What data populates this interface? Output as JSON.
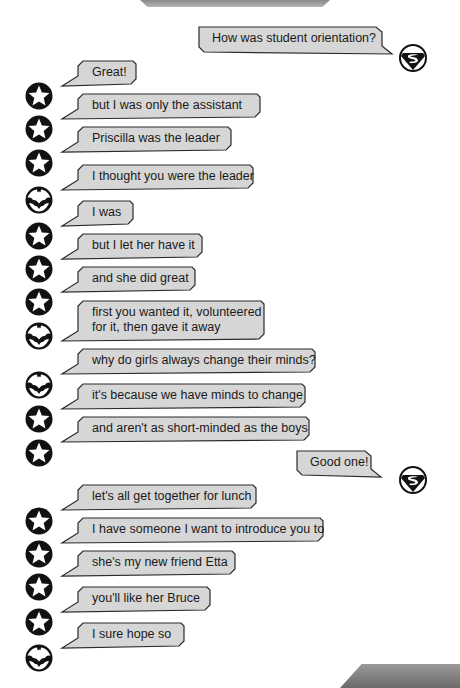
{
  "colors": {
    "bubble_fill": "#d6d6d6",
    "bubble_stroke": "#2a2a2a",
    "avatar": "#111111"
  },
  "messages": [
    {
      "side": "right",
      "avatar": "superman-icon",
      "text": "How was student orientation?",
      "x": 199,
      "y": 27,
      "w": 183,
      "h": 25,
      "ay": 44
    },
    {
      "side": "left",
      "avatar": "star-icon",
      "text": "Great!",
      "x": 78,
      "y": 61,
      "w": 58,
      "h": 23,
      "ay": 82
    },
    {
      "side": "left",
      "avatar": "star-icon",
      "text": "but I was only the assistant",
      "x": 78,
      "y": 94,
      "w": 182,
      "h": 23,
      "ay": 115
    },
    {
      "side": "left",
      "avatar": "star-icon",
      "text": "Priscilla was the leader",
      "x": 78,
      "y": 127,
      "w": 153,
      "h": 23,
      "ay": 149
    },
    {
      "side": "left",
      "avatar": "bat-icon",
      "text": "I thought you were the leader",
      "x": 78,
      "y": 165,
      "w": 175,
      "h": 23,
      "ay": 186
    },
    {
      "side": "left",
      "avatar": "star-icon",
      "text": "I was",
      "x": 78,
      "y": 201,
      "w": 55,
      "h": 23,
      "ay": 222
    },
    {
      "side": "left",
      "avatar": "star-icon",
      "text": "but I let her have it",
      "x": 78,
      "y": 234,
      "w": 124,
      "h": 23,
      "ay": 255
    },
    {
      "side": "left",
      "avatar": "star-icon",
      "text": "and she did great",
      "x": 78,
      "y": 267,
      "w": 117,
      "h": 23,
      "ay": 288
    },
    {
      "side": "left",
      "avatar": "bat-icon",
      "text": "first you wanted it, volunteered\nfor it, then gave it away",
      "x": 78,
      "y": 301,
      "w": 186,
      "h": 38,
      "ay": 322
    },
    {
      "side": "left",
      "avatar": "bat-icon",
      "text": "why do girls always change their minds?",
      "x": 78,
      "y": 349,
      "w": 237,
      "h": 23,
      "ay": 371
    },
    {
      "side": "left",
      "avatar": "star-icon",
      "text": "it's because we have minds to change",
      "x": 78,
      "y": 384,
      "w": 227,
      "h": 23,
      "ay": 405
    },
    {
      "side": "left",
      "avatar": "star-icon",
      "text": "and aren't as short-minded as the boys",
      "x": 78,
      "y": 417,
      "w": 231,
      "h": 23,
      "ay": 439
    },
    {
      "side": "right",
      "avatar": "superman-icon",
      "text": "Good one!",
      "x": 297,
      "y": 451,
      "w": 74,
      "h": 24,
      "ay": 466
    },
    {
      "side": "left",
      "avatar": "star-icon",
      "text": "let's all get together for lunch",
      "x": 78,
      "y": 485,
      "w": 178,
      "h": 23,
      "ay": 507
    },
    {
      "side": "left",
      "avatar": "star-icon",
      "text": "I have someone I want to introduce you to",
      "x": 78,
      "y": 518,
      "w": 245,
      "h": 23,
      "ay": 540
    },
    {
      "side": "left",
      "avatar": "star-icon",
      "text": "she's my new friend Etta",
      "x": 78,
      "y": 551,
      "w": 157,
      "h": 23,
      "ay": 573
    },
    {
      "side": "left",
      "avatar": "star-icon",
      "text": "you'll like her Bruce",
      "x": 78,
      "y": 587,
      "w": 132,
      "h": 23,
      "ay": 608
    },
    {
      "side": "left",
      "avatar": "bat-icon",
      "text": "I sure hope so",
      "x": 78,
      "y": 623,
      "w": 106,
      "h": 23,
      "ay": 644
    }
  ]
}
